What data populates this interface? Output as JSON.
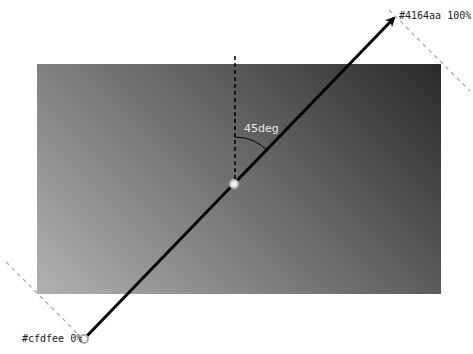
{
  "diagram": {
    "angle_label": "45deg",
    "start_stop": {
      "label": "#cfdfee 0%",
      "color": "#cfdfee",
      "position": "0%"
    },
    "end_stop": {
      "label": "#4164aa 100%",
      "color": "#4164aa",
      "position": "100%"
    },
    "rendered_colors": {
      "light_corner": "#b2b2b2",
      "dark_corner": "#2a2a2a"
    }
  }
}
